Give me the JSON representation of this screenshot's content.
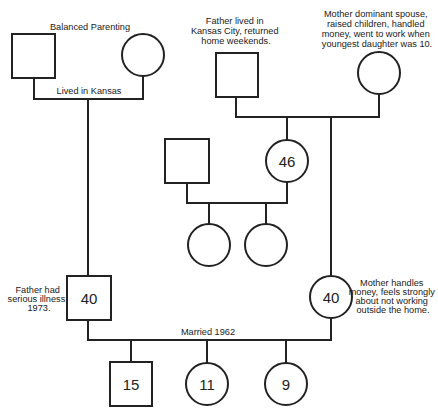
{
  "diagram": {
    "type": "genogram",
    "annotations": {
      "paternal_grandparents": "Balanced Parenting",
      "paternal_grandparents_marriage": "Lived in Kansas",
      "maternal_grandfather": [
        "Father lived in",
        "Kansas City, returned",
        "home weekends."
      ],
      "maternal_grandmother": [
        "Mother dominant spouse,",
        "raised children, handled",
        "money, went to work when",
        "youngest daughter was 10."
      ],
      "father": [
        "Father had",
        "serious illness,",
        "1973."
      ],
      "mother": [
        "Mother handles",
        "money, feels strongly",
        "about not working",
        "outside the home."
      ],
      "parents_marriage": "Married 1962"
    },
    "people": {
      "paternal_grandfather": {
        "sex": "male",
        "age": ""
      },
      "paternal_grandmother": {
        "sex": "female",
        "age": ""
      },
      "maternal_grandfather": {
        "sex": "male",
        "age": ""
      },
      "maternal_grandmother": {
        "sex": "female",
        "age": ""
      },
      "aunt_husband": {
        "sex": "male",
        "age": ""
      },
      "aunt": {
        "sex": "female",
        "age": "46"
      },
      "cousin_1": {
        "sex": "female",
        "age": ""
      },
      "cousin_2": {
        "sex": "female",
        "age": ""
      },
      "father": {
        "sex": "male",
        "age": "40"
      },
      "mother": {
        "sex": "female",
        "age": "40"
      },
      "son": {
        "sex": "male",
        "age": "15"
      },
      "daughter_1": {
        "sex": "female",
        "age": "11"
      },
      "daughter_2": {
        "sex": "female",
        "age": "9"
      }
    }
  }
}
